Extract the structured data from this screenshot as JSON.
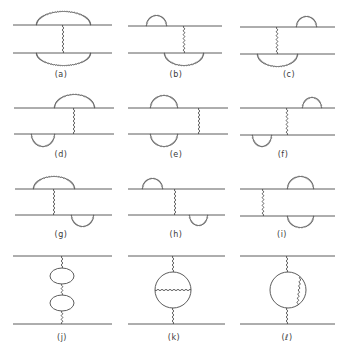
{
  "figure": {
    "line_color": "#4a4a4a",
    "background": "#ffffff",
    "panels": [
      {
        "id": "a",
        "label": "(a)",
        "label_x": 61,
        "label_y": 76,
        "top_y": 25,
        "bottom_y": 53,
        "x0": 13,
        "x1": 112,
        "exchange_x": [
          63
        ],
        "top_arcs": [
          [
            37,
            90,
            13
          ]
        ],
        "bottom_arcs": [
          [
            37,
            90,
            12
          ]
        ]
      },
      {
        "id": "b",
        "label": "(b)",
        "label_x": 176,
        "label_y": 76,
        "top_y": 26,
        "bottom_y": 53,
        "x0": 128,
        "x1": 222,
        "exchange_x": [
          184
        ],
        "top_arcs": [
          [
            147,
            166,
            10
          ]
        ],
        "bottom_arcs": [
          [
            165,
            203,
            12
          ]
        ]
      },
      {
        "id": "c",
        "label": "(c)",
        "label_x": 289,
        "label_y": 76,
        "top_y": 27,
        "bottom_y": 54,
        "x0": 240,
        "x1": 335,
        "exchange_x": [
          277
        ],
        "top_arcs": [
          [
            297,
            316,
            10
          ]
        ],
        "bottom_arcs": [
          [
            258,
            297,
            12
          ]
        ]
      },
      {
        "id": "d",
        "label": "(d)",
        "label_x": 61,
        "label_y": 156,
        "top_y": 108,
        "bottom_y": 134,
        "x0": 14,
        "x1": 114,
        "exchange_x": [
          74
        ],
        "top_arcs": [
          [
            55,
            94,
            13
          ]
        ],
        "bottom_arcs": [
          [
            32,
            54,
            12
          ]
        ]
      },
      {
        "id": "e",
        "label": "(e)",
        "label_x": 176,
        "label_y": 156,
        "top_y": 108,
        "bottom_y": 134,
        "x0": 128,
        "x1": 228,
        "exchange_x": [
          199
        ],
        "top_arcs": [
          [
            151,
            177,
            12
          ]
        ],
        "bottom_arcs": [
          [
            151,
            177,
            12
          ]
        ]
      },
      {
        "id": "f",
        "label": "(f)",
        "label_x": 283,
        "label_y": 156,
        "top_y": 108,
        "bottom_y": 135,
        "x0": 240,
        "x1": 335,
        "exchange_x": [
          287
        ],
        "top_arcs": [
          [
            303,
            321,
            10
          ]
        ],
        "bottom_arcs": [
          [
            253,
            271,
            11
          ]
        ]
      },
      {
        "id": "g",
        "label": "(g)",
        "label_x": 61,
        "label_y": 236,
        "top_y": 189,
        "bottom_y": 215,
        "x0": 15,
        "x1": 112,
        "exchange_x": [
          54
        ],
        "top_arcs": [
          [
            34,
            74,
            12
          ]
        ],
        "bottom_arcs": [
          [
            72,
            93,
            11
          ]
        ]
      },
      {
        "id": "h",
        "label": "(h)",
        "label_x": 176,
        "label_y": 236,
        "top_y": 189,
        "bottom_y": 215,
        "x0": 128,
        "x1": 225,
        "exchange_x": [
          175
        ],
        "top_arcs": [
          [
            143,
            162,
            10
          ]
        ],
        "bottom_arcs": [
          [
            190,
            207,
            10
          ]
        ]
      },
      {
        "id": "i",
        "label": "(i)",
        "label_x": 282,
        "label_y": 236,
        "top_y": 189,
        "bottom_y": 216,
        "x0": 240,
        "x1": 335,
        "exchange_x": [
          263
        ],
        "top_arcs": [
          [
            288,
            313,
            12
          ]
        ],
        "bottom_arcs": [
          [
            288,
            313,
            11
          ]
        ]
      },
      {
        "id": "j",
        "label": "(j)",
        "label_x": 62,
        "label_y": 339,
        "top_y": 256,
        "bottom_y": 324,
        "x0": 13,
        "x1": 112,
        "exchange_x": [
          62
        ],
        "ellipses": [
          [
            62,
            276,
            12,
            8
          ],
          [
            62,
            303,
            12,
            8
          ]
        ]
      },
      {
        "id": "k",
        "label": "(k)",
        "label_x": 174,
        "label_y": 339,
        "top_y": 256,
        "bottom_y": 324,
        "x0": 128,
        "x1": 225,
        "exchange_x": [
          173
        ],
        "circle": [
          173,
          290,
          18
        ],
        "chord": "horizontal"
      },
      {
        "id": "l",
        "label": "(ℓ)",
        "label_x": 287,
        "label_y": 339,
        "top_y": 256,
        "bottom_y": 324,
        "x0": 240,
        "x1": 335,
        "exchange_x": [
          287
        ],
        "circle": [
          288,
          290,
          18
        ],
        "chord": "right-vertical"
      }
    ]
  }
}
